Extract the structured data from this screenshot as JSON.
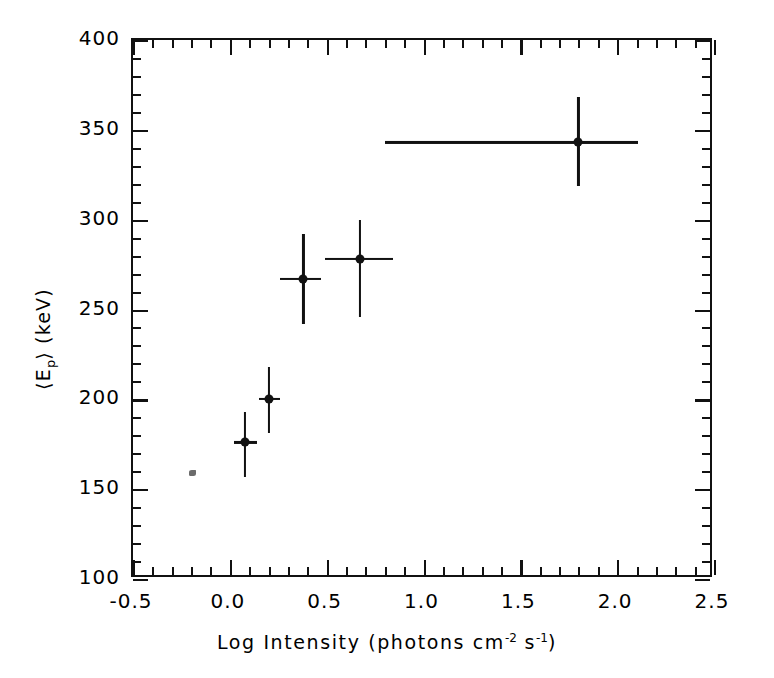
{
  "chart_data": {
    "type": "scatter",
    "title": "",
    "xlabel": "Log Intensity (photons cm-2 s-1)",
    "xlabel_parts": {
      "prefix": "Log Intensity (photons cm",
      "sup1": "-2",
      "mid": " s",
      "sup2": "-1",
      "suffix": ")"
    },
    "ylabel": "<Ep> (keV)",
    "ylabel_parts": {
      "open": "⟨E",
      "sub": "p",
      "close": "⟩ (keV)"
    },
    "xlim": [
      -0.5,
      2.5
    ],
    "ylim": [
      100,
      400
    ],
    "xticks": [
      -0.5,
      0.0,
      0.5,
      1.0,
      1.5,
      2.0,
      2.5
    ],
    "xticklabels": [
      "-0.5",
      "0.0",
      "0.5",
      "1.0",
      "1.5",
      "2.0",
      "2.5"
    ],
    "yticks": [
      100,
      150,
      200,
      250,
      300,
      350,
      400
    ],
    "yticklabels": [
      "100",
      "150",
      "200",
      "250",
      "300",
      "350",
      "400"
    ],
    "x_minor_step": 0.1,
    "y_minor_step": 10,
    "grid": false,
    "legend": null,
    "marker_style": "filled-circle",
    "points": [
      {
        "x": 0.08,
        "y": 176,
        "xerr_low": 0.06,
        "xerr_high": 0.06,
        "yerr_low": 19,
        "yerr_high": 17
      },
      {
        "x": 0.2,
        "y": 200,
        "xerr_low": 0.05,
        "xerr_high": 0.06,
        "yerr_low": 19,
        "yerr_high": 18
      },
      {
        "x": 0.38,
        "y": 267,
        "xerr_low": 0.12,
        "xerr_high": 0.09,
        "yerr_low": 25,
        "yerr_high": 25
      },
      {
        "x": 0.67,
        "y": 278,
        "xerr_low": 0.18,
        "xerr_high": 0.17,
        "yerr_low": 32,
        "yerr_high": 22
      },
      {
        "x": 1.8,
        "y": 343,
        "xerr_low": 1.0,
        "xerr_high": 0.31,
        "yerr_low": 24,
        "yerr_high": 25
      }
    ]
  },
  "figure": {
    "background_color": "#ffffff",
    "axis_color": "#111111",
    "marker_color": "#111111"
  }
}
